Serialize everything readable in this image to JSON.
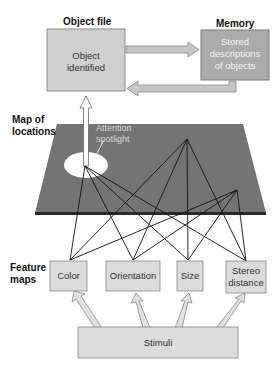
{
  "labels": {
    "object_file": "Object file",
    "memory": "Memory",
    "map_of_locations_line1": "Map of",
    "map_of_locations_line2": "locations",
    "feature_maps_line1": "Feature",
    "feature_maps_line2": "maps"
  },
  "boxes": {
    "object_identified_line1": "Object",
    "object_identified_line2": "identified",
    "stored_line1": "Stored",
    "stored_line2": "descriptions",
    "stored_line3": "of objects",
    "attention_line1": "Attention",
    "attention_line2": "spotlight",
    "stimuli": "Stimuli"
  },
  "features": [
    {
      "label_line1": "Color",
      "label_line2": ""
    },
    {
      "label_line1": "Orientation",
      "label_line2": ""
    },
    {
      "label_line1": "Size",
      "label_line2": ""
    },
    {
      "label_line1": "Stereo",
      "label_line2": "distance"
    }
  ],
  "colors": {
    "object_box": "#cfcfcf",
    "memory_box": "#ababab",
    "plane": "#747474",
    "plane_edge": "#2a2a2a",
    "feature_box": "#dcdcdc",
    "arrow_fill": "#e0e0e0",
    "line": "#111111"
  }
}
